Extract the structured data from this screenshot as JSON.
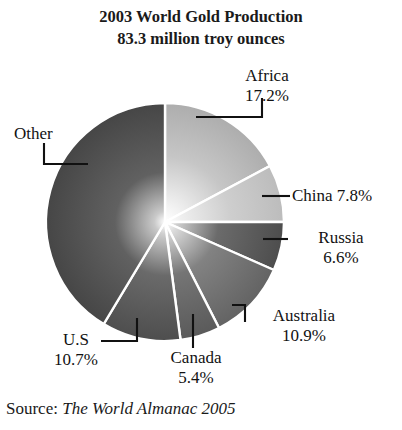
{
  "title": {
    "line1": "2003 World Gold Production",
    "line2": "83.3 million troy ounces"
  },
  "source": {
    "prefix": "Source:",
    "publication": "The World Almanac 2005"
  },
  "labels": {
    "africa": {
      "name": "Africa",
      "value": "17.2%"
    },
    "china": {
      "name": "China",
      "value": "7.8%",
      "combined": "China 7.8%"
    },
    "russia": {
      "name": "Russia",
      "value": "6.6%"
    },
    "australia": {
      "name": "Australia",
      "value": "10.9%"
    },
    "canada": {
      "name": "Canada",
      "value": "5.4%"
    },
    "us": {
      "name": "U.S",
      "value": "10.7%"
    },
    "other": {
      "name": "Other",
      "value": ""
    }
  },
  "chart_data": {
    "type": "pie",
    "title": "2003 World Gold Production\n83.3 million troy ounces",
    "unit": "million troy ounces",
    "total": 83.3,
    "value_suffix": "%",
    "start_angle_deg": 0,
    "direction": "clockwise",
    "legend": "none",
    "labels_shown": [
      "Africa",
      "China",
      "Russia",
      "Australia",
      "Canada",
      "U.S",
      "Other"
    ],
    "categories": [
      "Africa",
      "China",
      "Russia",
      "Australia",
      "Canada",
      "U.S",
      "Other"
    ],
    "values": [
      17.2,
      7.8,
      6.6,
      10.9,
      5.4,
      10.7,
      41.4
    ],
    "slices": [
      {
        "label": "Africa",
        "percent": 17.2,
        "display": "17.2%",
        "color": "#b9b9b9",
        "start_deg": 0.0,
        "end_deg": 61.9
      },
      {
        "label": "China",
        "percent": 7.8,
        "display": "7.8%",
        "color": "#c2c2c2",
        "start_deg": 61.9,
        "end_deg": 90.0
      },
      {
        "label": "Russia",
        "percent": 6.6,
        "display": "6.6%",
        "color": "#575757",
        "start_deg": 90.0,
        "end_deg": 113.8
      },
      {
        "label": "Australia",
        "percent": 10.9,
        "display": "10.9%",
        "color": "#6e6e6e",
        "start_deg": 113.8,
        "end_deg": 153.0
      },
      {
        "label": "Canada",
        "percent": 5.4,
        "display": "5.4%",
        "color": "#636363",
        "start_deg": 153.0,
        "end_deg": 172.5
      },
      {
        "label": "U.S",
        "percent": 10.7,
        "display": "10.7%",
        "color": "#575757",
        "start_deg": 172.5,
        "end_deg": 211.0
      },
      {
        "label": "Other",
        "percent": 41.4,
        "display": "",
        "color": "#4f4f4f",
        "start_deg": 211.0,
        "end_deg": 360.0
      }
    ],
    "geometry": {
      "cx": 165,
      "cy": 222,
      "r": 119
    },
    "separator_color": "#ffffff",
    "background": "#ffffff"
  }
}
